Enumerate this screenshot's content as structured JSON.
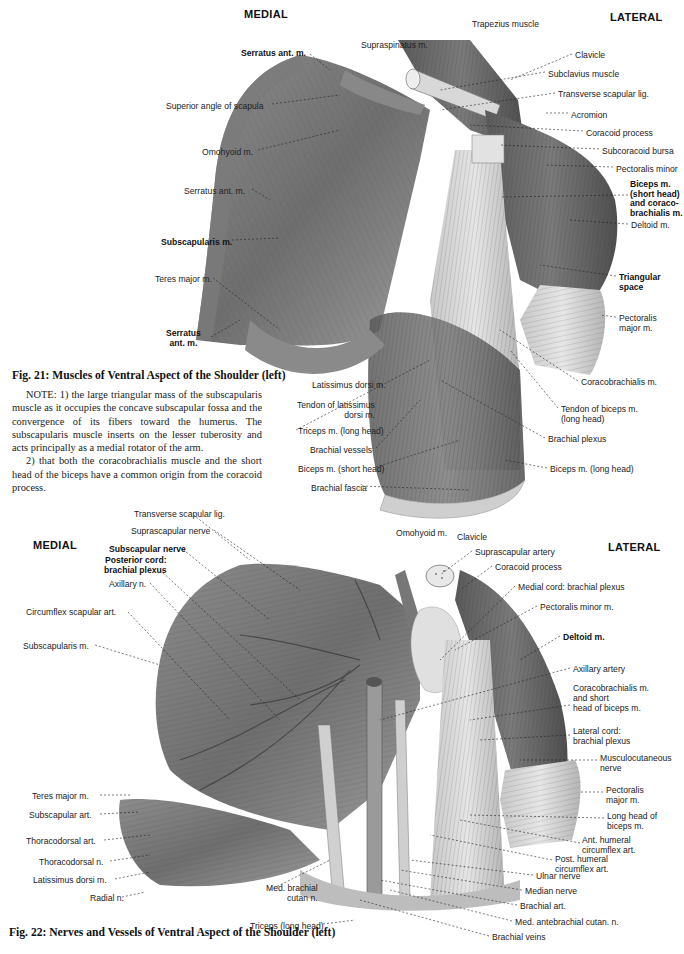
{
  "figure21": {
    "orientation": {
      "medial": "MEDIAL",
      "lateral": "LATERAL"
    },
    "caption": "Fig. 21:  Muscles of Ventral Aspect of the Shoulder (left)",
    "note": [
      "NOTE: 1) the large triangular mass of the subscapularis muscle as it occupies the concave subscapular fossa and the convergence of its fibers toward the humerus. The subscapularis muscle inserts on the lesser tuberosity and acts principally as a medial rotator of the arm.",
      "2) that both the coracobrachialis muscle and the short head of the biceps have a common origin from the coracoid process."
    ],
    "labels_left": [
      {
        "text": "Serratus ant. m.",
        "bold": true
      },
      {
        "text": "Superior angle of scapula",
        "bold": false
      },
      {
        "text": "Omohyoid m.",
        "bold": false
      },
      {
        "text": "Serratus ant. m.",
        "bold": false
      },
      {
        "text": "Subscapularis m.",
        "bold": true
      },
      {
        "text": "Teres major m.",
        "bold": false
      },
      {
        "text": "Serratus\nant. m.",
        "bold": true
      },
      {
        "text": "Latissimus dorsi m.",
        "bold": false
      },
      {
        "text": "Tendon of latissimus\ndorsi m.",
        "bold": false
      },
      {
        "text": "Triceps m. (long head)",
        "bold": false
      },
      {
        "text": "Brachial vessels",
        "bold": false
      },
      {
        "text": "Biceps m. (short head)",
        "bold": false
      },
      {
        "text": "Brachial fascia",
        "bold": false
      }
    ],
    "labels_top": [
      {
        "text": "Supraspinatus m.",
        "bold": false
      },
      {
        "text": "Trapezius muscle",
        "bold": false
      }
    ],
    "labels_right": [
      {
        "text": "Clavicle",
        "bold": false
      },
      {
        "text": "Subclavius muscle",
        "bold": false
      },
      {
        "text": "Transverse scapular lig.",
        "bold": false
      },
      {
        "text": "Acromion",
        "bold": false
      },
      {
        "text": "Coracoid process",
        "bold": false
      },
      {
        "text": "Subcoracoid bursa",
        "bold": false
      },
      {
        "text": "Pectoralis minor",
        "bold": false
      },
      {
        "text": "Biceps m.\n(short head)\nand coraco-\nbrachialis m.",
        "bold": true
      },
      {
        "text": "Deltoid m.",
        "bold": false
      },
      {
        "text": "Triangular\nspace",
        "bold": true
      },
      {
        "text": "Pectoralis\nmajor m.",
        "bold": false
      },
      {
        "text": "Coracobrachialis m.",
        "bold": false
      },
      {
        "text": "Tendon of biceps m.\n(long head)",
        "bold": false
      },
      {
        "text": "Brachial plexus",
        "bold": false
      },
      {
        "text": "Biceps m. (long head)",
        "bold": false
      }
    ]
  },
  "figure22": {
    "orientation": {
      "medial": "MEDIAL",
      "lateral": "LATERAL"
    },
    "caption": "Fig. 22:  Nerves and Vessels of Ventral Aspect of the Shoulder (left)",
    "labels_left": [
      {
        "text": "Transverse scapular lig.",
        "bold": false
      },
      {
        "text": "Suprascapular nerve",
        "bold": false
      },
      {
        "text": "Subscapular nerve",
        "bold": true
      },
      {
        "text": "Posterior cord:\nbrachial plexus",
        "bold": true
      },
      {
        "text": "Axillary n.",
        "bold": false
      },
      {
        "text": "Circumflex scapular art.",
        "bold": false
      },
      {
        "text": "Subscapularis m.",
        "bold": false
      },
      {
        "text": "Teres major m.",
        "bold": false
      },
      {
        "text": "Subscapular art.",
        "bold": false
      },
      {
        "text": "Thoracodorsal art.",
        "bold": false
      },
      {
        "text": "Thoracodorsal n.",
        "bold": false
      },
      {
        "text": "Latissimus dorsi m.",
        "bold": false
      },
      {
        "text": "Radial n.",
        "bold": false
      },
      {
        "text": "Med. brachial\ncutan n.",
        "bold": false
      },
      {
        "text": "Triceps (long head)",
        "bold": false
      }
    ],
    "labels_top": [
      {
        "text": "Omohyoid m.",
        "bold": false
      },
      {
        "text": "Clavicle",
        "bold": false
      }
    ],
    "labels_right": [
      {
        "text": "Suprascapular artery",
        "bold": false
      },
      {
        "text": "Coracoid process",
        "bold": false
      },
      {
        "text": "Medial cord: brachial plexus",
        "bold": false
      },
      {
        "text": "Pectoralis minor m.",
        "bold": false
      },
      {
        "text": "Deltoid m.",
        "bold": true
      },
      {
        "text": "Axillary artery",
        "bold": false
      },
      {
        "text": "Coracobrachialis m.\nand short\nhead of biceps m.",
        "bold": false
      },
      {
        "text": "Lateral cord:\nbrachial plexus",
        "bold": false
      },
      {
        "text": "Musculocutaneous\nnerve",
        "bold": false
      },
      {
        "text": "Pectoralis\nmajor m.",
        "bold": false
      },
      {
        "text": "Long head of\nbiceps m.",
        "bold": false
      },
      {
        "text": "Ant. humeral\ncircumflex art.",
        "bold": false
      },
      {
        "text": "Post. humeral\ncircumflex art.",
        "bold": false
      },
      {
        "text": "Ulnar nerve",
        "bold": false
      },
      {
        "text": "Median nerve",
        "bold": false
      },
      {
        "text": "Brachial art.",
        "bold": false
      },
      {
        "text": "Med. antebrachial cutan. n.",
        "bold": false
      },
      {
        "text": "Brachial veins",
        "bold": false
      }
    ]
  }
}
